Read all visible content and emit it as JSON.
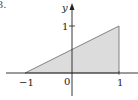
{
  "figure": {
    "corner_label": "3.",
    "y_axis_label": "y",
    "y_tick_label": "1",
    "x_tick_labels": [
      "−1",
      "0",
      "1"
    ],
    "shape": "triangle",
    "vertices": [
      [
        -1,
        0
      ],
      [
        1,
        0
      ],
      [
        1,
        1
      ]
    ],
    "colors": {
      "fill": "#dcdcdc",
      "stroke": "#555555",
      "axis": "#222222"
    }
  }
}
